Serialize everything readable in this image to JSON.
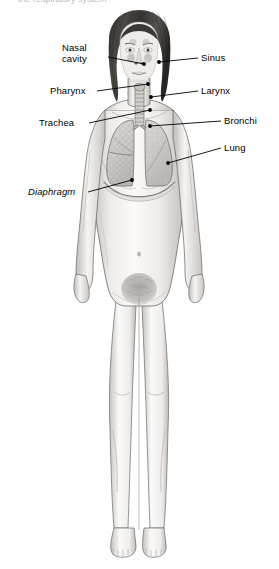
{
  "diagram": {
    "background_color": "#ffffff",
    "line_color": "#000000",
    "text_color": "#000000",
    "cropped_header_text": "the respiratory system",
    "labels": [
      {
        "id": "nasal-cavity",
        "text": "Nasal\ncavity",
        "line1": "Nasal",
        "line2": "cavity",
        "side": "left",
        "italic": false,
        "text_x": 62,
        "text_y": 46,
        "leader_start_x": 108,
        "leader_start_y": 57,
        "leader_end_x": 144,
        "leader_end_y": 64,
        "dot_x": 144,
        "dot_y": 64
      },
      {
        "id": "sinus",
        "text": "Sinus",
        "line1": "Sinus",
        "line2": "",
        "side": "right",
        "italic": false,
        "text_x": 201,
        "text_y": 52,
        "leader_start_x": 198,
        "leader_start_y": 58,
        "leader_end_x": 159,
        "leader_end_y": 62,
        "dot_x": 159,
        "dot_y": 62
      },
      {
        "id": "pharynx",
        "text": "Pharynx",
        "line1": "Pharynx",
        "line2": "",
        "side": "left",
        "italic": false,
        "text_x": 50,
        "text_y": 85,
        "leader_start_x": 97,
        "leader_start_y": 91,
        "leader_end_x": 148,
        "leader_end_y": 84,
        "dot_x": 148,
        "dot_y": 84
      },
      {
        "id": "larynx",
        "text": "Larynx",
        "line1": "Larynx",
        "line2": "",
        "side": "right",
        "italic": false,
        "text_x": 201,
        "text_y": 85,
        "leader_start_x": 198,
        "leader_start_y": 91,
        "leader_end_x": 151,
        "leader_end_y": 97,
        "dot_x": 151,
        "dot_y": 97
      },
      {
        "id": "trachea",
        "text": "Trachea",
        "line1": "Trachea",
        "line2": "",
        "side": "left",
        "italic": false,
        "text_x": 39,
        "text_y": 117,
        "leader_start_x": 89,
        "leader_start_y": 123,
        "leader_end_x": 150,
        "leader_end_y": 110,
        "dot_x": 150,
        "dot_y": 110
      },
      {
        "id": "bronchi",
        "text": "Bronchi",
        "line1": "Bronchi",
        "line2": "",
        "side": "right",
        "italic": false,
        "text_x": 224,
        "text_y": 115,
        "leader_start_x": 221,
        "leader_start_y": 121,
        "leader_end_x": 150,
        "leader_end_y": 126,
        "dot_x": 150,
        "dot_y": 126
      },
      {
        "id": "lung",
        "text": "Lung",
        "line1": "Lung",
        "line2": "",
        "side": "right",
        "italic": false,
        "text_x": 224,
        "text_y": 142,
        "leader_start_x": 221,
        "leader_start_y": 148,
        "leader_end_x": 168,
        "leader_end_y": 163,
        "dot_x": 168,
        "dot_y": 163
      },
      {
        "id": "diaphragm",
        "text": "Diaphragm",
        "line1": "Diaphragm",
        "line2": "",
        "side": "left",
        "italic": true,
        "text_x": 28,
        "text_y": 186,
        "leader_start_x": 88,
        "leader_start_y": 192,
        "leader_end_x": 132,
        "leader_end_y": 180,
        "dot_x": 132,
        "dot_y": 180
      }
    ],
    "anatomy_parts": [
      {
        "id": "head-hair",
        "name": "Hair"
      },
      {
        "id": "face",
        "name": "Face"
      },
      {
        "id": "neck",
        "name": "Neck"
      },
      {
        "id": "torso",
        "name": "Torso"
      },
      {
        "id": "left-arm",
        "name": "Left arm"
      },
      {
        "id": "right-arm",
        "name": "Right arm"
      },
      {
        "id": "legs",
        "name": "Legs"
      },
      {
        "id": "feet",
        "name": "Feet"
      },
      {
        "id": "lung-right",
        "name": "Right lung"
      },
      {
        "id": "lung-left",
        "name": "Left lung"
      },
      {
        "id": "trachea-tube",
        "name": "Trachea"
      },
      {
        "id": "bronchi-tubes",
        "name": "Bronchi"
      },
      {
        "id": "diaphragm-arc",
        "name": "Diaphragm"
      },
      {
        "id": "sinus-region",
        "name": "Sinus"
      },
      {
        "id": "nasal-region",
        "name": "Nasal cavity"
      },
      {
        "id": "navel",
        "name": "Navel"
      },
      {
        "id": "pubic-hair",
        "name": "Pubic hair"
      }
    ],
    "colors": {
      "skin_light": "#f6f4f2",
      "skin_shade": "#d9d5d2",
      "skin_edge": "#8d8a88",
      "hair_dark": "#3a3734",
      "hair_mid": "#5e5a56",
      "lung_fill": "#cfcbc8",
      "lung_texture": "#9b9794",
      "outline": "#5a5754",
      "leader": "#000000"
    }
  }
}
